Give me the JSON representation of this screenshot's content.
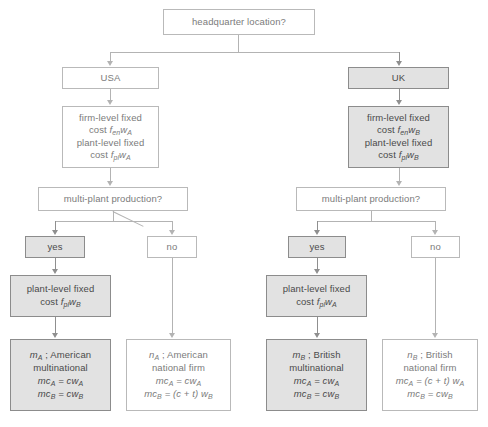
{
  "diagram": {
    "type": "decision-tree",
    "colors": {
      "shaded_fill": "#e2e2e2",
      "plain_fill": "#ffffff",
      "border_shaded": "#8c8c8c",
      "border_plain": "#b9b9b9",
      "text_shaded": "#4a4a4a",
      "text_plain": "#7b7b7b",
      "connector": "#b3b3b3"
    }
  },
  "root": {
    "label": "headquarter location?"
  },
  "left_branch": {
    "country": "USA",
    "fixed_costs": {
      "line1": "firm-level fixed",
      "line2_prefix": "cost ",
      "line2_f": "f",
      "line2_f_sub": "en",
      "line2_w": "w",
      "line2_w_sub": "A",
      "line3": "plant-level fixed",
      "line4_prefix": "cost ",
      "line4_f": "f",
      "line4_f_sub": "pl",
      "line4_w": "w",
      "line4_w_sub": "A"
    },
    "question": "multi-plant production?",
    "yes_label": "yes",
    "no_label": "no",
    "extra_plant_cost": {
      "line1": "plant-level fixed",
      "line2_prefix": "cost ",
      "f": "f",
      "f_sub": "pl",
      "w": "w",
      "w_sub": "B"
    },
    "outcome_yes": {
      "symbol": "m",
      "symbol_sub": "A",
      "sep": " ; ",
      "name_line1": "American",
      "name_line2": "multinational",
      "mc1_lhs": "mc",
      "mc1_lhs_sub": "A",
      "mc1_rhs": " = cw",
      "mc1_rhs_sub": "A",
      "mc2_lhs": "mc",
      "mc2_lhs_sub": "B",
      "mc2_rhs": " = cw",
      "mc2_rhs_sub": "B"
    },
    "outcome_no": {
      "symbol": "n",
      "symbol_sub": "A",
      "sep": " ; ",
      "name_line1": "American",
      "name_line2": "national firm",
      "mc1_lhs": "mc",
      "mc1_lhs_sub": "A",
      "mc1_rhs": " = cw",
      "mc1_rhs_sub": "A",
      "mc2_lhs": "mc",
      "mc2_lhs_sub": "B",
      "mc2_rhs": " = (c + t) w",
      "mc2_rhs_sub": "B"
    }
  },
  "right_branch": {
    "country": "UK",
    "fixed_costs": {
      "line1": "firm-level fixed",
      "line2_prefix": "cost ",
      "line2_f": "f",
      "line2_f_sub": "en",
      "line2_w": "w",
      "line2_w_sub": "B",
      "line3": "plant-level fixed",
      "line4_prefix": "cost ",
      "line4_f": "f",
      "line4_f_sub": "pl",
      "line4_w": "w",
      "line4_w_sub": "B"
    },
    "question": "multi-plant production?",
    "yes_label": "yes",
    "no_label": "no",
    "extra_plant_cost": {
      "line1": "plant-level fixed",
      "line2_prefix": "cost ",
      "f": "f",
      "f_sub": "pl",
      "w": "w",
      "w_sub": "A"
    },
    "outcome_yes": {
      "symbol": "m",
      "symbol_sub": "B",
      "sep": " ; ",
      "name_line1": "British",
      "name_line2": "multinational",
      "mc1_lhs": "mc",
      "mc1_lhs_sub": "A",
      "mc1_rhs": " = cw",
      "mc1_rhs_sub": "A",
      "mc2_lhs": "mc",
      "mc2_lhs_sub": "B",
      "mc2_rhs": " = cw",
      "mc2_rhs_sub": "B"
    },
    "outcome_no": {
      "symbol": "n",
      "symbol_sub": "B",
      "sep": " ; ",
      "name_line1": "British",
      "name_line2": "national firm",
      "mc1_lhs": "mc",
      "mc1_lhs_sub": "A",
      "mc1_rhs": " = (c + t) w",
      "mc1_rhs_sub": "A",
      "mc2_lhs": "mc",
      "mc2_lhs_sub": "B",
      "mc2_rhs": " = cw",
      "mc2_rhs_sub": "B"
    }
  }
}
